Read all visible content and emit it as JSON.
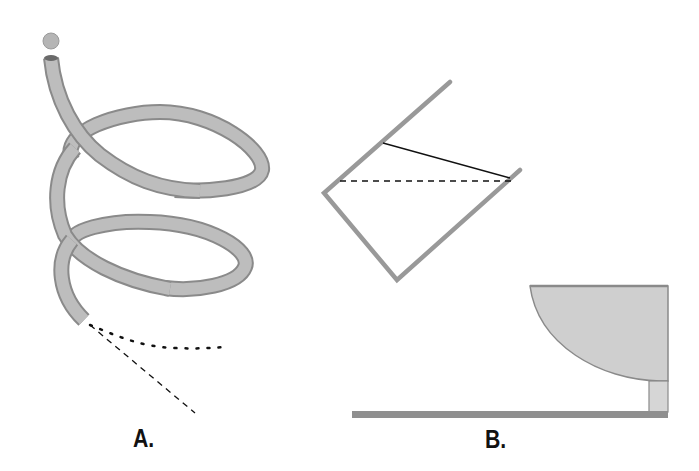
{
  "figure": {
    "panels": [
      {
        "id": "A",
        "label": "A.",
        "description": "Coiled tube (spiral hose) with a ball at the top entrance; ball exits the bottom end, with dotted curved path and dashed straight path shown"
      },
      {
        "id": "B",
        "label": "B.",
        "description": "Tilted open square container with solid and dashed water-level lines; shallow bowl on a stand resting on a floor surface at right"
      }
    ],
    "colors": {
      "tube_fill": "#b8b8b8",
      "tube_edge": "#8a8a8a",
      "container_stroke": "#999999",
      "bowl_fill": "#cfcfcf",
      "floor": "#8f8f8f",
      "ink": "#111111"
    }
  }
}
